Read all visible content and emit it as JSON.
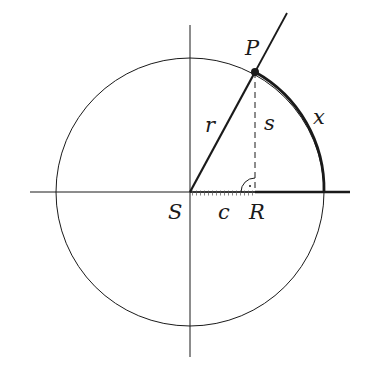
{
  "diagram": {
    "labels": {
      "P": "P",
      "S": "S",
      "R": "R",
      "r": "r",
      "s": "s",
      "c": "c",
      "x": "x"
    },
    "geometry": {
      "center": [
        190,
        192
      ],
      "radius": 134,
      "point_P": [
        255,
        72
      ],
      "point_R": [
        255,
        192
      ],
      "ray_end": [
        287,
        13
      ]
    },
    "colors": {
      "stroke": "#1a1a1a",
      "background": "#ffffff"
    }
  }
}
